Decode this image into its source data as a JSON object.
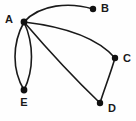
{
  "figure": {
    "type": "graph-diagram",
    "background_color": "#fefefe",
    "stroke_color": "#1a1a1a",
    "node_color": "#111111",
    "width": 136,
    "height": 121
  },
  "graph_data": {
    "type": "graph",
    "directed": false,
    "multigraph": true,
    "node_count": 5,
    "edge_count": 5,
    "nodes": [
      {
        "id": "A",
        "label": "A",
        "x": 24,
        "y": 22,
        "r": 3.4,
        "label_x": 13,
        "label_y": 20,
        "label_anchor": "end"
      },
      {
        "id": "B",
        "label": "B",
        "x": 93,
        "y": 9,
        "r": 3.2,
        "label_x": 101,
        "label_y": 9,
        "label_anchor": "start"
      },
      {
        "id": "C",
        "label": "C",
        "x": 115,
        "y": 58,
        "r": 3.2,
        "label_x": 123,
        "label_y": 59,
        "label_anchor": "start"
      },
      {
        "id": "D",
        "label": "D",
        "x": 100,
        "y": 103,
        "r": 3.2,
        "label_x": 108,
        "label_y": 109,
        "label_anchor": "start"
      },
      {
        "id": "E",
        "label": "E",
        "x": 24,
        "y": 90,
        "r": 3.4,
        "label_x": 24,
        "label_y": 103,
        "label_anchor": "middle"
      }
    ],
    "edges": [
      {
        "id": "A-B",
        "source": "A",
        "target": "B",
        "curve": "arc-up",
        "path": "M 24 22 C 40 4 70 2 93 9"
      },
      {
        "id": "A-C",
        "source": "A",
        "target": "C",
        "curve": "arc-down",
        "path": "M 24 22 C 58 26 96 36 115 58"
      },
      {
        "id": "A-D",
        "source": "A",
        "target": "D",
        "curve": "slight",
        "path": "M 24 22 C 48 50 78 82 100 103"
      },
      {
        "id": "A-E-left",
        "source": "A",
        "target": "E",
        "curve": "bow-left",
        "path": "M 24 22 C 12 44 12 70 24 90"
      },
      {
        "id": "A-E-right",
        "source": "A",
        "target": "E",
        "curve": "bow-right",
        "path": "M 24 22 C 34 44 34 70 24 90"
      },
      {
        "id": "C-D",
        "source": "C",
        "target": "D",
        "curve": "slight",
        "path": "M 115 58 C 110 75 104 90 100 103"
      }
    ]
  }
}
